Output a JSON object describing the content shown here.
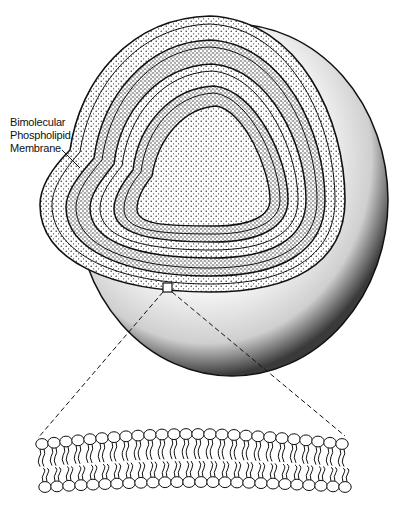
{
  "diagram": {
    "label": {
      "line1": "Bimolecular",
      "line2": "Phospholipid",
      "line3": "Membrane"
    },
    "lamellae_count": 5,
    "colors": {
      "ink": "#111111",
      "background": "#ffffff"
    }
  }
}
